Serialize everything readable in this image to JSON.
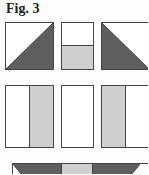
{
  "figure": {
    "title": "Fig. 3"
  },
  "colors": {
    "dark": "#5e5e5e",
    "light": "#cfcfcf",
    "white": "#ffffff",
    "stroke": "#444444"
  },
  "rows": [
    {
      "name": "row-1",
      "pieces": [
        "half-square-triangle-dark-bottom-right",
        "rectangle-white-over-light",
        "half-square-triangle-dark-bottom-left"
      ]
    },
    {
      "name": "row-2",
      "pieces": [
        "rectangle-white-left-light-right",
        "rectangle-white",
        "rectangle-light-left-white-right"
      ]
    },
    {
      "name": "row-3",
      "pieces": [
        "flying-geese-dark-light-dark"
      ]
    }
  ]
}
